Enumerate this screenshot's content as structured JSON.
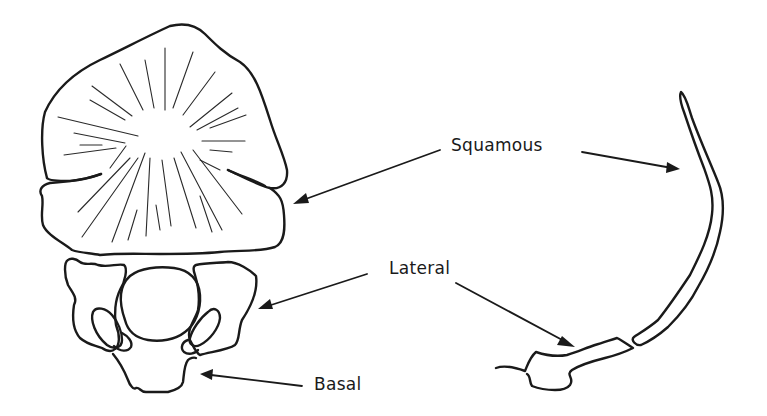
{
  "figure": {
    "labels": {
      "squamous": "Squamous",
      "lateral": "Lateral",
      "basal": "Basal"
    },
    "colors": {
      "ink": "#1a1a1a",
      "background": "#ffffff"
    },
    "views": [
      {
        "name": "front-view",
        "parts": [
          "squamous",
          "lateral",
          "lateral",
          "basal"
        ]
      },
      {
        "name": "side-view",
        "parts": [
          "squamous",
          "lateral"
        ]
      }
    ],
    "arrows": [
      {
        "from_label": "squamous",
        "to": "front-view squamous"
      },
      {
        "from_label": "squamous",
        "to": "side-view squamous"
      },
      {
        "from_label": "lateral",
        "to": "front-view lateral"
      },
      {
        "from_label": "lateral",
        "to": "side-view lateral"
      },
      {
        "from_label": "basal",
        "to": "front-view basal"
      }
    ]
  }
}
